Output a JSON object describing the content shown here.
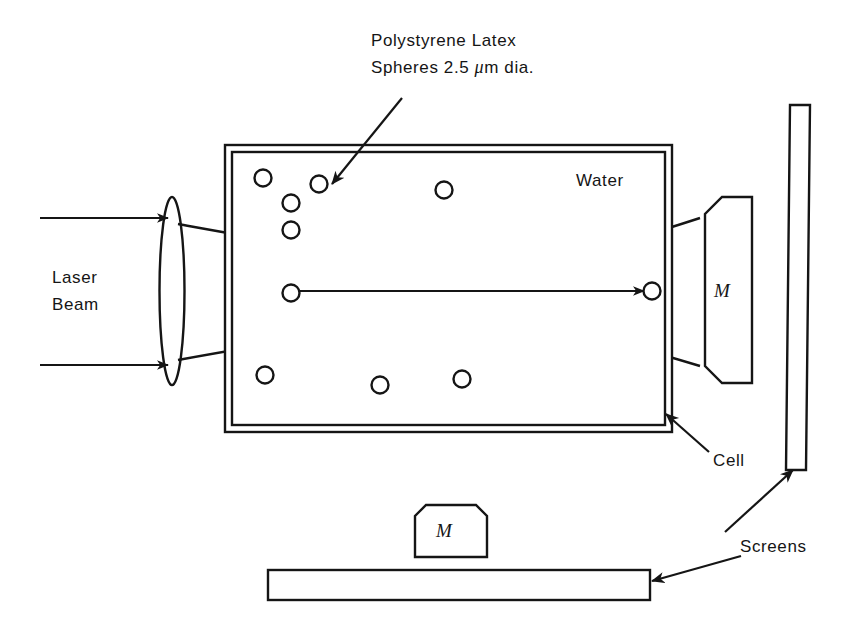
{
  "figure": {
    "background_color": "#ffffff",
    "line_color": "#151515"
  },
  "labels": {
    "polystyrene_line1": "Polystyrene Latex",
    "polystyrene_line2_pre": "Spheres 2.5 ",
    "polystyrene_mu": "μ",
    "polystyrene_line2_post": "m dia.",
    "laser_line1": "Laser",
    "laser_line2": "Beam",
    "water": "Water",
    "cell": "Cell",
    "screens": "Screens",
    "mirror_right": "M",
    "mirror_bottom": "M"
  },
  "components": {
    "lens": {
      "name": "focusing-lens",
      "cx": 172,
      "cy": 291,
      "rx": 12.5,
      "ry": 94
    },
    "cell": {
      "name": "sample-cell",
      "outer": {
        "x": 225,
        "y": 145,
        "width": 447,
        "height": 287
      },
      "inner_inset": 7
    },
    "mirror_right": {
      "x": 705,
      "y": 197,
      "width": 47,
      "height": 186,
      "chamfer": 17
    },
    "mirror_bottom": {
      "x": 415,
      "y": 505,
      "width": 72,
      "height": 52,
      "chamfer": 11
    },
    "screen_vertical": {
      "top_x": 790,
      "top_y": 105,
      "bottom_x": 786,
      "bottom_y": 470,
      "width": 20
    },
    "screen_horizontal": {
      "x": 268,
      "y": 570,
      "width": 382,
      "height": 30
    }
  },
  "spheres": [
    {
      "cx": 263,
      "cy": 178,
      "r": 8.5
    },
    {
      "cx": 319,
      "cy": 184,
      "r": 8.5
    },
    {
      "cx": 291,
      "cy": 203,
      "r": 8.5
    },
    {
      "cx": 291,
      "cy": 230,
      "r": 8.5
    },
    {
      "cx": 444,
      "cy": 190,
      "r": 8.5
    },
    {
      "cx": 265,
      "cy": 375,
      "r": 8.5
    },
    {
      "cx": 380,
      "cy": 385,
      "r": 8.5
    },
    {
      "cx": 462,
      "cy": 379,
      "r": 8.5
    },
    {
      "cx": 291,
      "cy": 293,
      "r": 8.5
    },
    {
      "cx": 652,
      "cy": 291,
      "r": 8.5
    }
  ],
  "beams": {
    "incoming_top": {
      "x1": 40,
      "y1": 218,
      "x2": 168,
      "y2": 218
    },
    "incoming_bottom": {
      "x1": 40,
      "y1": 365,
      "x2": 168,
      "y2": 365
    },
    "envelope_top": "M 178,224 C 300,246 420,268 470,268 C 540,268 620,244 700,218",
    "envelope_bottom": "M 178,360 C 300,338 420,318 470,318 C 540,318 620,342 700,366",
    "center_axis": {
      "x1": 300,
      "y1": 291,
      "x2": 644,
      "y2": 291
    }
  },
  "leaders": {
    "polystyrene": {
      "x1": 402,
      "y1": 98,
      "x2": 332,
      "y2": 184
    },
    "cell": {
      "x1": 709,
      "y1": 452,
      "x2": 666,
      "y2": 414
    },
    "screen_up": {
      "x1": 725,
      "y1": 532,
      "x2": 793,
      "y2": 470
    },
    "screen_down": {
      "x1": 741,
      "y1": 556,
      "x2": 652,
      "y2": 581
    }
  },
  "text_positions": {
    "polystyrene_line1": {
      "x": 371,
      "y": 46
    },
    "polystyrene_line2": {
      "x": 371,
      "y": 73
    },
    "laser_line1": {
      "x": 52,
      "y": 283
    },
    "laser_line2": {
      "x": 52,
      "y": 310
    },
    "water": {
      "x": 576,
      "y": 186
    },
    "cell": {
      "x": 713,
      "y": 466
    },
    "screens": {
      "x": 740,
      "y": 552
    },
    "mirror_right": {
      "x": 722,
      "y": 297
    },
    "mirror_bottom": {
      "x": 444,
      "y": 537
    }
  }
}
